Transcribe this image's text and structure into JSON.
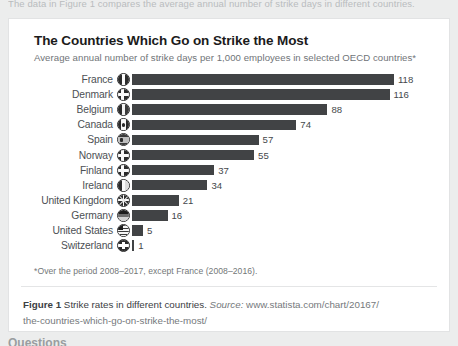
{
  "page": {
    "intro_text": "The data in Figure 1 compares the average annual number of strike days in different countries.",
    "questions_heading": "Questions",
    "background_color": "#eceded",
    "card_background": "#ffffff"
  },
  "chart_data": {
    "type": "bar",
    "orientation": "horizontal",
    "title": "The Countries Which Go on Strike the Most",
    "subtitle": "Average annual number of strike days per 1,000 employees in selected OECD countries*",
    "xlabel": "",
    "ylabel": "",
    "bar_color": "#414345",
    "grid": false,
    "legend": "none",
    "xlim": [
      0,
      118
    ],
    "categories": [
      "France",
      "Denmark",
      "Belgium",
      "Canada",
      "Spain",
      "Norway",
      "Finland",
      "Ireland",
      "United Kingdom",
      "Germany",
      "United States",
      "Switzerland"
    ],
    "values": [
      118,
      116,
      88,
      74,
      57,
      55,
      37,
      34,
      21,
      16,
      5,
      1
    ],
    "flags": [
      "flag-france",
      "flag-denmark",
      "flag-belgium",
      "flag-canada",
      "flag-spain",
      "flag-norway",
      "flag-finland",
      "flag-ireland",
      "flag-united-kingdom",
      "flag-germany",
      "flag-united-states",
      "flag-switzerland"
    ],
    "footnote": "*Over the period 2008–2017, except France (2008–2016)."
  },
  "caption": {
    "figure_label": "Figure 1",
    "text": "Strike rates in different countries.",
    "source_label": "Source:",
    "url_line1": "www.statista.com/chart/20167/",
    "url_line2": "the-countries-which-go-on-strike-the-most/"
  }
}
